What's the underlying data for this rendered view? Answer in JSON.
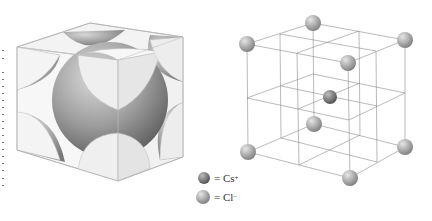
{
  "figure": {
    "left_panel": {
      "description": "Space-filling unit cell: large central sphere with corner sphere sections cut by cube faces",
      "colors": {
        "face": "#efefef",
        "edge": "#b9b9b9",
        "sphere_light": "#d8d8d8",
        "sphere_dark": "#6d6d6d"
      }
    },
    "right_panel": {
      "description": "Ball-and-stick lattice of CsCl showing 8 corner ions and 1 body-center ion",
      "line_color": "#8c8c8c",
      "atoms": [
        {
          "id": "top-back",
          "x": 313,
          "y": 23,
          "r": 8,
          "ion": "Cl"
        },
        {
          "id": "top-left",
          "x": 247,
          "y": 44,
          "r": 8,
          "ion": "Cl"
        },
        {
          "id": "top-right",
          "x": 405,
          "y": 40,
          "r": 8,
          "ion": "Cl"
        },
        {
          "id": "top-front",
          "x": 348,
          "y": 63,
          "r": 8,
          "ion": "Cl"
        },
        {
          "id": "center",
          "x": 330,
          "y": 97,
          "r": 7,
          "ion": "Cs"
        },
        {
          "id": "bottom-back",
          "x": 314,
          "y": 124,
          "r": 8,
          "ion": "Cl"
        },
        {
          "id": "bottom-left",
          "x": 248,
          "y": 152,
          "r": 8,
          "ion": "Cl"
        },
        {
          "id": "bottom-right",
          "x": 405,
          "y": 147,
          "r": 8,
          "ion": "Cl"
        },
        {
          "id": "bottom-front",
          "x": 350,
          "y": 178,
          "r": 8,
          "ion": "Cl"
        }
      ]
    },
    "legend": [
      {
        "symbol": "= Cs",
        "charge": "+",
        "color": "#7a7a7a"
      },
      {
        "symbol": "= Cl",
        "charge": "−",
        "color": "#a8a8a8"
      }
    ]
  }
}
